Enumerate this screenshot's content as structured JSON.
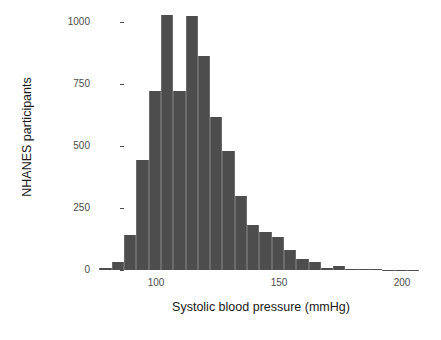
{
  "chart_data": {
    "type": "bar",
    "title": "",
    "xlabel": "Systolic blood pressure (mmHg)",
    "ylabel": "NHANES participants",
    "xlim": [
      74,
      212
    ],
    "ylim": [
      0,
      1080
    ],
    "grid": false,
    "legend": null,
    "bin_width": 5,
    "bar_color": "#4d4d4d",
    "xticks": [
      100,
      150,
      200
    ],
    "xticklabels": [
      "100",
      "150",
      "200"
    ],
    "yticks": [
      0,
      250,
      500,
      750,
      1000
    ],
    "yticklabels": [
      "0",
      "250",
      "500",
      "750",
      "1000"
    ],
    "bins": [
      {
        "left": 77,
        "right": 82,
        "center": 79.5,
        "value": 8
      },
      {
        "left": 82,
        "right": 87,
        "center": 84.5,
        "value": 32
      },
      {
        "left": 87,
        "right": 92,
        "center": 89.5,
        "value": 140
      },
      {
        "left": 92,
        "right": 97,
        "center": 94.5,
        "value": 445
      },
      {
        "left": 97,
        "right": 102,
        "center": 99.5,
        "value": 720
      },
      {
        "left": 102,
        "right": 107,
        "center": 104.5,
        "value": 1030
      },
      {
        "left": 107,
        "right": 112,
        "center": 109.5,
        "value": 720
      },
      {
        "left": 112,
        "right": 117,
        "center": 114.5,
        "value": 1025
      },
      {
        "left": 117,
        "right": 122,
        "center": 119.5,
        "value": 862
      },
      {
        "left": 122,
        "right": 127,
        "center": 124.5,
        "value": 618
      },
      {
        "left": 127,
        "right": 132,
        "center": 129.5,
        "value": 478
      },
      {
        "left": 132,
        "right": 137,
        "center": 134.5,
        "value": 300
      },
      {
        "left": 137,
        "right": 142,
        "center": 139.5,
        "value": 180
      },
      {
        "left": 142,
        "right": 147,
        "center": 144.5,
        "value": 152
      },
      {
        "left": 147,
        "right": 152,
        "center": 149.5,
        "value": 132
      },
      {
        "left": 152,
        "right": 157,
        "center": 154.5,
        "value": 80
      },
      {
        "left": 157,
        "right": 162,
        "center": 159.5,
        "value": 46
      },
      {
        "left": 162,
        "right": 167,
        "center": 164.5,
        "value": 34
      },
      {
        "left": 167,
        "right": 172,
        "center": 169.5,
        "value": 10
      },
      {
        "left": 172,
        "right": 177,
        "center": 174.5,
        "value": 18
      },
      {
        "left": 177,
        "right": 182,
        "center": 179.5,
        "value": 6
      },
      {
        "left": 182,
        "right": 187,
        "center": 184.5,
        "value": 4
      },
      {
        "left": 187,
        "right": 192,
        "center": 189.5,
        "value": 3
      },
      {
        "left": 192,
        "right": 197,
        "center": 194.5,
        "value": 2
      },
      {
        "left": 197,
        "right": 202,
        "center": 199.5,
        "value": 2
      },
      {
        "left": 202,
        "right": 207,
        "center": 204.5,
        "value": 2
      }
    ]
  }
}
